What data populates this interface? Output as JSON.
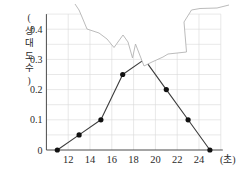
{
  "chart_data": {
    "type": "line",
    "subtype": "relative-frequency-polygon-with-torn-corner",
    "title": "",
    "xlabel": "(초)",
    "ylabel": "(상대도수)",
    "ylabel_chars": [
      "(",
      "상",
      "대",
      "도",
      "수",
      ")"
    ],
    "x_midpoints": [
      11,
      13,
      15,
      17,
      19,
      21,
      23,
      25
    ],
    "values": [
      0,
      0.05,
      0.1,
      0.25,
      0.3,
      0.2,
      0.1,
      0
    ],
    "hidden_peak_index": 4,
    "hidden_peak_note": "vertex at (19, 0.30) is covered by the torn-paper region; no dot drawn there",
    "xticks": [
      "12",
      "14",
      "16",
      "18",
      "20",
      "22",
      "24"
    ],
    "xtick_values": [
      12,
      14,
      16,
      18,
      20,
      22,
      24
    ],
    "yticks": [
      "0",
      "0.1",
      "0.2",
      "0.3",
      "0.4"
    ],
    "ytick_values": [
      0,
      0.1,
      0.2,
      0.3,
      0.4
    ],
    "xlim": [
      10,
      26
    ],
    "ylim": [
      0,
      0.45
    ],
    "grid": "on",
    "grid_x_step": 2,
    "grid_y_step": 0.05,
    "colors": {
      "polygon_line": "#3c3c3c",
      "data_dot": "#111111",
      "tear_edge": "#b3b3b3",
      "gridline": "#d9d9d9",
      "axis": "#4a4a4a",
      "background": "#ffffff"
    },
    "tear_edge_px": [
      [
        75,
        4
      ],
      [
        79,
        10
      ],
      [
        82,
        17
      ],
      [
        87,
        29
      ],
      [
        99,
        33
      ],
      [
        107,
        39
      ],
      [
        114,
        47.5
      ],
      [
        123,
        35
      ],
      [
        128,
        42
      ],
      [
        132.5,
        58
      ],
      [
        135.5,
        44
      ],
      [
        144,
        66
      ],
      [
        152,
        62
      ],
      [
        163,
        57
      ],
      [
        168,
        54
      ],
      [
        186.5,
        52
      ],
      [
        184,
        22
      ],
      [
        191.5,
        10
      ],
      [
        200,
        8.5
      ],
      [
        217,
        8
      ],
      [
        229,
        5
      ]
    ]
  }
}
